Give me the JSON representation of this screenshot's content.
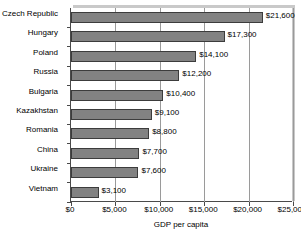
{
  "chart_data": {
    "type": "bar",
    "orientation": "horizontal",
    "title": "",
    "xlabel": "GDP per capita",
    "ylabel": "",
    "categories": [
      "Czech Republic",
      "Hungary",
      "Poland",
      "Russia",
      "Bulgaria",
      "Kazakhstan",
      "Romania",
      "China",
      "Ukraine",
      "Vietnam"
    ],
    "values": [
      21600,
      17300,
      14100,
      12200,
      10400,
      9100,
      8800,
      7700,
      7600,
      3100
    ],
    "value_labels": [
      "$21,600",
      "$17,300",
      "$14,100",
      "$12,200",
      "$10,400",
      "$9,100",
      "$8,800",
      "$7,700",
      "$7,600",
      "$3,100"
    ],
    "xlim": [
      0,
      25000
    ],
    "xticks": [
      0,
      5000,
      10000,
      15000,
      20000,
      25000
    ],
    "xtick_labels": [
      "$0",
      "$5,000",
      "$10,000",
      "$15,000",
      "$20,000",
      "$25,000"
    ],
    "grid": true,
    "legend": false,
    "bar_color": "#828282",
    "bar_edge_color": "#3c3c3c",
    "gridline_color": "#9a9a9a",
    "axis_color": "#4a4a4a",
    "plot_background": "#ffffff",
    "shadow_color": "#c9c9c9"
  }
}
